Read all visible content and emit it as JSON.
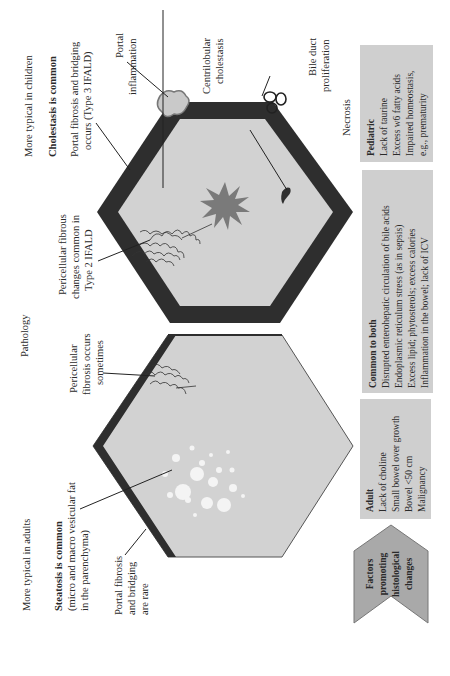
{
  "figure": {
    "title": "Pathology",
    "children_column": {
      "heading": "More typical in children",
      "subheading": "Cholestasis is common",
      "portal_fibrosis": [
        "Portal fibrosis and bridging",
        "occurs (Type 3 IFALD)"
      ],
      "portal_inflammation": [
        "Portal",
        "inflammation"
      ],
      "centrilobular": [
        "Centrilobular",
        "cholestasis"
      ],
      "bile_duct": [
        "Bile duct",
        "proliferation"
      ],
      "necrosis": "Necrosis",
      "pericellular": [
        "Pericellular fibrous",
        "changes common in",
        "Type 2 IFALD"
      ]
    },
    "adults_column": {
      "heading": "More typical in adults",
      "subheading": "Steatosis is common",
      "steatosis_detail": [
        "(micro and macro vesicular fat",
        "in the parenchyma)"
      ],
      "portal_fibrosis": [
        "Portal fibrosis",
        "and bridging",
        "are rare"
      ],
      "pericellular": [
        "Pericellular",
        "fibrosis occurs",
        "sometimes"
      ]
    },
    "factors": {
      "chevron_label": [
        "Factors",
        "promoting",
        "histological",
        "changes"
      ],
      "adult": {
        "title": "Adult",
        "items": [
          "Lack of choline",
          "Small bowel over growth",
          "Bowel <50 cm",
          "Malignancy"
        ]
      },
      "common": {
        "title": "Common to both",
        "items": [
          "Disrupted enterohepatic circulation of bile acids",
          "Endoplasmic reticulum stress (as in sepsis)",
          "Excess lipid; phytosterols; excess calories",
          "Inflammation in the bowel; lack of ICV"
        ]
      },
      "pediatric": {
        "title": "Pediatric",
        "items": [
          "Lack of taurine",
          "Excess w6 fatty acids",
          "Impaired homeostasis,",
          "e.g., prematurity"
        ]
      }
    },
    "colors": {
      "hex_fill": "#d2d2d2",
      "hex_border": "#2e2e2e",
      "box_fill": "#cfcfcf",
      "chevron_fill": "#a9a9a9",
      "star": "#7a7a7a",
      "fat": "#f4f4f4"
    }
  }
}
